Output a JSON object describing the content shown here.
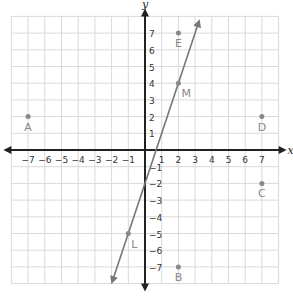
{
  "plane": {
    "x_axis_label": "x",
    "y_axis_label": "y",
    "x_ticks": [
      "-7",
      "-6",
      "-5",
      "-4",
      "-3",
      "-2",
      "-1",
      "1",
      "2",
      "3",
      "4",
      "5",
      "6",
      "7"
    ],
    "y_ticks": [
      "7",
      "6",
      "5",
      "4",
      "3",
      "2",
      "1",
      "-1",
      "-2",
      "-3",
      "-4",
      "-5",
      "-6",
      "-7"
    ],
    "range": {
      "xmin": -8,
      "xmax": 8,
      "ymin": -8,
      "ymax": 8
    },
    "grid_color": "#d9d9d9",
    "axis_color": "#222222",
    "line_color": "#777777",
    "point_color": "#888888"
  },
  "points": [
    {
      "label": "A",
      "x": -7,
      "y": 2
    },
    {
      "label": "B",
      "x": 2,
      "y": -7
    },
    {
      "label": "C",
      "x": 7,
      "y": -2
    },
    {
      "label": "D",
      "x": 7,
      "y": 2
    },
    {
      "label": "E",
      "x": 2,
      "y": 7
    },
    {
      "label": "L",
      "x": -1,
      "y": -5
    },
    {
      "label": "M",
      "x": 2,
      "y": 4
    }
  ],
  "line": {
    "through": [
      "L",
      "M"
    ],
    "equation": "y = 3x - 2"
  }
}
